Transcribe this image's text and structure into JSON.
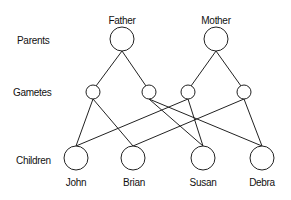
{
  "rows": {
    "parents": "Parents",
    "gametes": "Gametes",
    "children": "Children"
  },
  "parents": [
    {
      "name": "Father"
    },
    {
      "name": "Mother"
    }
  ],
  "children": [
    {
      "name": "John"
    },
    {
      "name": "Brian"
    },
    {
      "name": "Susan"
    },
    {
      "name": "Debra"
    }
  ],
  "colors": {
    "line": "#222222",
    "background": "#ffffff"
  }
}
